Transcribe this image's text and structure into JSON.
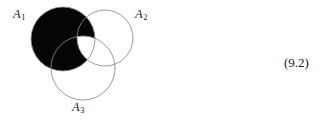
{
  "figure": {
    "caption_number": "(9.2)",
    "labels": [
      {
        "id": "A1",
        "base": "A",
        "subscript": "1"
      },
      {
        "id": "A2",
        "base": "A",
        "subscript": "2"
      },
      {
        "id": "A3",
        "base": "A",
        "subscript": "3"
      }
    ],
    "colors": {
      "fill": "#050505",
      "stroke": "#8a8a8a",
      "background": "#ffffff",
      "text": "#1a1a1a"
    },
    "circles": [
      {
        "id": "A1",
        "cx": 63,
        "cy": 39,
        "r": 32,
        "filled": true
      },
      {
        "id": "A2",
        "cx": 105,
        "cy": 38,
        "r": 28,
        "filled": false
      },
      {
        "id": "A3",
        "cx": 83,
        "cy": 68,
        "r": 32,
        "filled": false
      }
    ]
  }
}
